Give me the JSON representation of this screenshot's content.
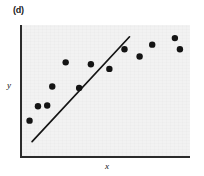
{
  "figure": {
    "panel_label": "(d)",
    "background_color": "#ffffff",
    "plot_background_color": "#f2f2f2",
    "axis_color": "#2b2b2b",
    "mark_color": "#141414"
  },
  "chart_data": {
    "type": "scatter",
    "title": "(d)",
    "xlabel": "x",
    "ylabel": "y",
    "grid": false,
    "legend": null,
    "xlim": [
      0,
      10
    ],
    "ylim": [
      0,
      10
    ],
    "x_tick_labels": [],
    "y_tick_labels": [],
    "points": [
      {
        "x": 0.45,
        "y": 2.7
      },
      {
        "x": 0.95,
        "y": 3.8
      },
      {
        "x": 1.5,
        "y": 3.85
      },
      {
        "x": 1.8,
        "y": 5.3
      },
      {
        "x": 2.6,
        "y": 7.15
      },
      {
        "x": 3.4,
        "y": 5.2
      },
      {
        "x": 4.1,
        "y": 7.0
      },
      {
        "x": 5.2,
        "y": 6.65
      },
      {
        "x": 6.1,
        "y": 8.15
      },
      {
        "x": 7.0,
        "y": 7.6
      },
      {
        "x": 7.75,
        "y": 8.5
      },
      {
        "x": 9.1,
        "y": 9.0
      },
      {
        "x": 9.4,
        "y": 8.15
      }
    ],
    "fit_line": {
      "label": "fitted line",
      "x_start": 0.6,
      "y_start": 1.1,
      "x_end": 6.4,
      "y_end": 9.1
    },
    "annotations": [
      {
        "text": "(d)",
        "position": "top-left"
      }
    ]
  }
}
